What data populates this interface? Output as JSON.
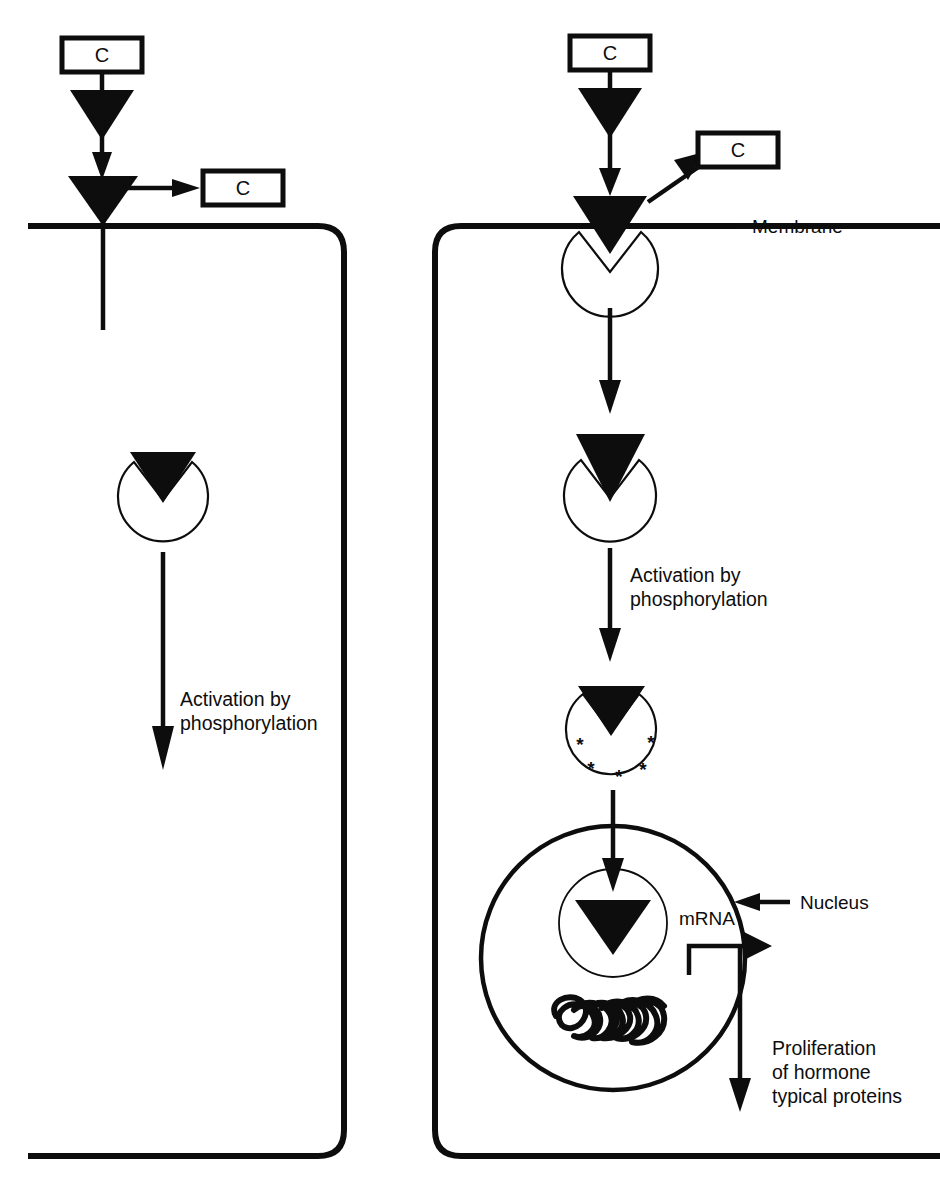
{
  "figure": {
    "background_color": "#ffffff",
    "ink_color": "#0d0d0d"
  },
  "labels": {
    "ligand_box_left_top": "C",
    "ligand_box_left_released": "C",
    "ligand_box_right_top": "C",
    "ligand_box_right_released": "C",
    "membrane": "Membrane",
    "nucleus": "Nucleus",
    "mrna": "mRNA",
    "activation_left_line1": "Activation by",
    "activation_left_line2": "phosphorylation",
    "activation_right_line1": "Activation by",
    "activation_right_line2": "phosphorylation",
    "proliferation_line1": "Proliferation",
    "proliferation_line2": "of hormone",
    "proliferation_line3": "typical proteins"
  },
  "panels": {
    "left": {
      "name": "left-pathway-panel",
      "steps": [
        "ligand-box-c",
        "ligand-triangle",
        "binding-arrow",
        "membrane-receptor-triangle",
        "released-ligand-box-c",
        "transmembrane-stem",
        "cytoplasmic-receptor-circle",
        "activation-arrow",
        "activation-label"
      ]
    },
    "right": {
      "name": "right-pathway-panel",
      "steps": [
        "ligand-box-c",
        "ligand-triangle",
        "binding-arrow",
        "membrane-receptor-complex",
        "released-ligand-box-c",
        "internalization-arrow",
        "cytoplasmic-receptor-circle",
        "activation-arrow",
        "activation-label",
        "phosphorylated-receptor-circle",
        "nuclear-translocation-arrow",
        "nucleus",
        "nuclear-receptor-circle",
        "chromatin",
        "mrna-arrow",
        "export-arrow",
        "proliferation-label"
      ]
    }
  },
  "marks": {
    "phosphorylation_asterisk": "*",
    "phosphorylation_asterisk_count": 5
  }
}
